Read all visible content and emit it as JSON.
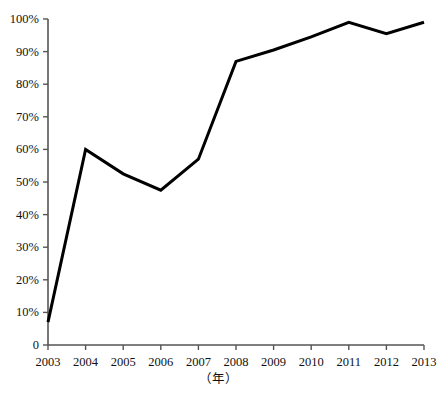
{
  "chart_data": {
    "type": "line",
    "title": "",
    "xlabel": "（年）",
    "ylabel": "",
    "x": [
      2003,
      2004,
      2005,
      2006,
      2007,
      2008,
      2009,
      2010,
      2011,
      2012,
      2013
    ],
    "categories": [
      "2003",
      "2004",
      "2005",
      "2006",
      "2007",
      "2008",
      "2009",
      "2010",
      "2011",
      "2012",
      "2013"
    ],
    "values": [
      7,
      60,
      52.5,
      47.5,
      57,
      87,
      90.5,
      94.5,
      99,
      95.5,
      99
    ],
    "ylim": [
      0,
      100
    ],
    "xlim": [
      2003,
      2013
    ],
    "ytick_labels": [
      "0",
      "10%",
      "20%",
      "30%",
      "40%",
      "50%",
      "60%",
      "70%",
      "80%",
      "90%",
      "100%"
    ],
    "ytick_values": [
      0,
      10,
      20,
      30,
      40,
      50,
      60,
      70,
      80,
      90,
      100
    ],
    "xtick_labels": [
      "2003",
      "2004",
      "2005",
      "2006",
      "2007",
      "2008",
      "2009",
      "2010",
      "2011",
      "2012",
      "2013"
    ],
    "grid": false,
    "legend": null,
    "legend_position": "none",
    "line_color": "#000000",
    "line_width": 3,
    "axis_color": "#555555",
    "background_color": "#ffffff",
    "markers": false,
    "annotations": []
  },
  "axis": {
    "x_caption": "（年）",
    "y_ticks": [
      {
        "label": "100%",
        "value": 100
      },
      {
        "label": "90%",
        "value": 90
      },
      {
        "label": "80%",
        "value": 80
      },
      {
        "label": "70%",
        "value": 70
      },
      {
        "label": "60%",
        "value": 60
      },
      {
        "label": "50%",
        "value": 50
      },
      {
        "label": "40%",
        "value": 40
      },
      {
        "label": "30%",
        "value": 30
      },
      {
        "label": "20%",
        "value": 20
      },
      {
        "label": "10%",
        "value": 10
      },
      {
        "label": "0",
        "value": 0
      }
    ],
    "x_ticks": [
      {
        "label": "2003",
        "value": 2003
      },
      {
        "label": "2004",
        "value": 2004
      },
      {
        "label": "2005",
        "value": 2005
      },
      {
        "label": "2006",
        "value": 2006
      },
      {
        "label": "2007",
        "value": 2007
      },
      {
        "label": "2008",
        "value": 2008
      },
      {
        "label": "2009",
        "value": 2009
      },
      {
        "label": "2010",
        "value": 2010
      },
      {
        "label": "2011",
        "value": 2011
      },
      {
        "label": "2012",
        "value": 2012
      },
      {
        "label": "2013",
        "value": 2013
      }
    ]
  },
  "caption": {
    "text": ""
  },
  "colors": {
    "line": "#000000",
    "axis": "#555555",
    "text": "#111111",
    "background": "#ffffff"
  }
}
